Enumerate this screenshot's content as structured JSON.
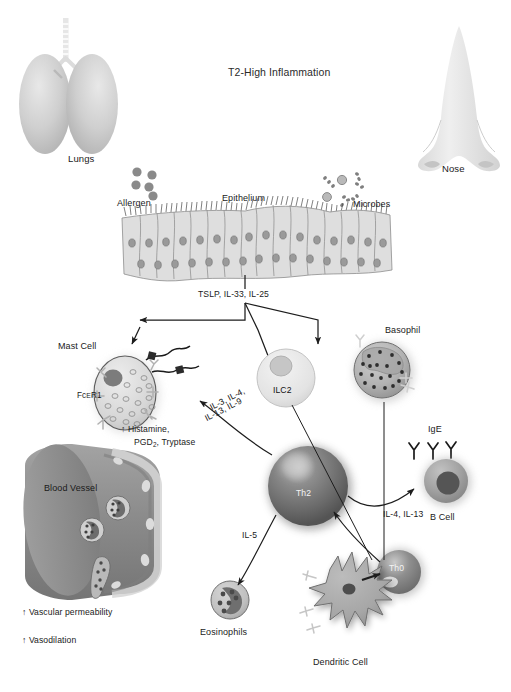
{
  "figure": {
    "title": "T2-High Inflammation",
    "type": "immunology-pathway-diagram"
  },
  "organs": {
    "lungs_label": "Lungs",
    "nose_label": "Nose"
  },
  "triggers": {
    "allergen_label": "Allergen",
    "microbes_label": "Microbes"
  },
  "barrier": {
    "epithelium_label": "Epithelium",
    "alarmins_label": "TSLP, IL-33, IL-25"
  },
  "cells": {
    "mast_cell": "Mast Cell",
    "mast_receptor": "FcER1",
    "mast_receptor_prefix": "Fc",
    "mast_receptor_smallcaps": "E",
    "mast_receptor_suffix": "R1",
    "ilc2": "ILC2",
    "basophil": "Basophil",
    "th2": "Th2",
    "th0": "Th0",
    "b_cell": "B Cell",
    "eosinophils": "Eosinophils",
    "dendritic_cell": "Dendritic Cell",
    "ige": "IgE",
    "blood_vessel": "Blood Vessel"
  },
  "mediators": {
    "mast_output_line1": "↑ Histamine,",
    "mast_output_line2_a": "PGD",
    "mast_output_line2_sub": "2",
    "mast_output_line2_b": ", Tryptase"
  },
  "cytokines": {
    "to_mast_line1": "IL-3, IL-4,",
    "to_mast_line2": "IL-13, IL-9",
    "to_eosinophils": "IL-5",
    "to_b_cell": "IL-4, IL-13"
  },
  "vascular": {
    "permeability": "↑ Vascular permeability",
    "vasodilation": "↑ Vasodilation"
  },
  "colors": {
    "ink": "#1a1a1a",
    "arrow": "#1d1d1d",
    "lung_fill": "#c6c6c6",
    "nose_fill": "#e2e2e2",
    "epithelium_fill": "#dededc",
    "epithelium_stroke": "#8d8d8d",
    "particle": "#8a8a8a",
    "mast_fill": "#d8d8d8",
    "th2_fill": "#6e6e6e",
    "vessel_fill": "#8f8f8f",
    "dendritic_fill": "#a9a9a9",
    "basophil_fill": "#b4b4b4",
    "b_cell_fill": "#9b9b9b"
  }
}
